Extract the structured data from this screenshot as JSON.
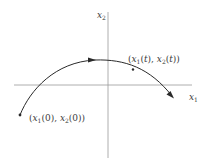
{
  "diagram": {
    "type": "phase-plane trajectory",
    "axes": {
      "x_label": "x1",
      "y_label": "x2",
      "x_label_parts": {
        "var": "x",
        "sub": "1"
      },
      "y_label_parts": {
        "var": "x",
        "sub": "2"
      }
    },
    "points": {
      "initial": {
        "label": "(x1(0), x2(0))",
        "parts": {
          "open": "(",
          "v1": "x",
          "s1": "1",
          "a1": "(0), ",
          "v2": "x",
          "s2": "2",
          "a2": "(0))"
        }
      },
      "current": {
        "label": "(x1(t), x2(t))",
        "parts": {
          "open": "(",
          "v1": "x",
          "s1": "1",
          "a1": "(",
          "t1": "t",
          "c1": "), ",
          "v2": "x",
          "s2": "2",
          "a2": "(",
          "t2": "t",
          "c2": "))"
        }
      }
    },
    "colors": {
      "axis": "#9a9a9a",
      "curve": "#2a2a2a",
      "text": "#3a3a3a"
    }
  }
}
